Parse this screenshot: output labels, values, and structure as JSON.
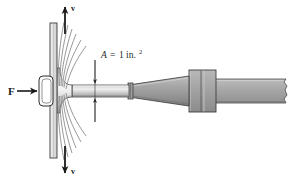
{
  "figure": {
    "caption": "",
    "labels": {
      "force": "F",
      "velocity_top": "v",
      "velocity_bottom": "v",
      "area_symbol": "A",
      "area_equals": "=",
      "area_value": "1",
      "area_unit": "in.",
      "area_unit_exponent": "2"
    },
    "colors": {
      "background": "#ffffff",
      "outline": "#2b2b2b",
      "tool_body": "#a8a8a8",
      "tool_light": "#c9c9c9",
      "tool_dark": "#8a8a8a",
      "plate": "#e4e4e4",
      "fiber": "#8d8d8d",
      "text": "#1a1a1a"
    },
    "parts": {
      "handle": "handle-plate",
      "plate": "vertical-plate",
      "punch_head": "flared-punch-head",
      "shaft": "punch-shaft",
      "taper": "tapered-cone",
      "collar": "collar-block",
      "rod": "rear-rod",
      "break": "break-edge"
    }
  }
}
